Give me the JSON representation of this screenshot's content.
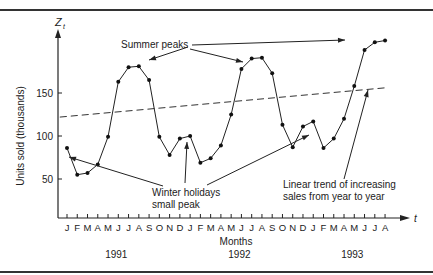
{
  "chart_data": {
    "type": "line",
    "title": "",
    "xlabel": "Months",
    "ylabel": "Units sold (thousands)",
    "y_axis_symbol": "Z",
    "y_axis_subscript": "t",
    "x_axis_symbol": "t",
    "ylim": [
      0,
      215
    ],
    "yticks": [
      50,
      100,
      150
    ],
    "grid": false,
    "months": [
      "J",
      "F",
      "M",
      "A",
      "M",
      "J",
      "J",
      "A",
      "S",
      "O",
      "N",
      "D",
      "J",
      "F",
      "M",
      "A",
      "M",
      "J",
      "J",
      "A",
      "S",
      "O",
      "N",
      "D",
      "J",
      "F",
      "M",
      "A",
      "M",
      "J",
      "J",
      "A"
    ],
    "years": [
      {
        "label": "1991",
        "center_index": 5
      },
      {
        "label": "1992",
        "center_index": 17
      },
      {
        "label": "1993",
        "center_index": 28
      }
    ],
    "series": [
      {
        "name": "Units sold",
        "style": "solid-with-dots",
        "values": [
          86,
          55,
          57,
          67,
          99,
          163,
          180,
          181,
          165,
          99,
          78,
          97,
          100,
          69,
          74,
          89,
          125,
          178,
          190,
          191,
          173,
          113,
          87,
          111,
          117,
          86,
          97,
          120,
          158,
          200,
          209,
          211
        ]
      },
      {
        "name": "Linear trend",
        "style": "dashed",
        "start": {
          "index": -0.7,
          "value": 122
        },
        "end": {
          "index": 31,
          "value": 156
        }
      }
    ],
    "annotations": [
      {
        "text": "Summer peaks",
        "lines": [
          "Summer peaks"
        ]
      },
      {
        "text": "Winter holidays small peak",
        "lines": [
          "Winter holidays",
          "small peak"
        ]
      },
      {
        "text": "Linear trend of increasing sales from year to year",
        "lines": [
          "Linear trend of increasing",
          "sales from year to year"
        ]
      }
    ]
  }
}
